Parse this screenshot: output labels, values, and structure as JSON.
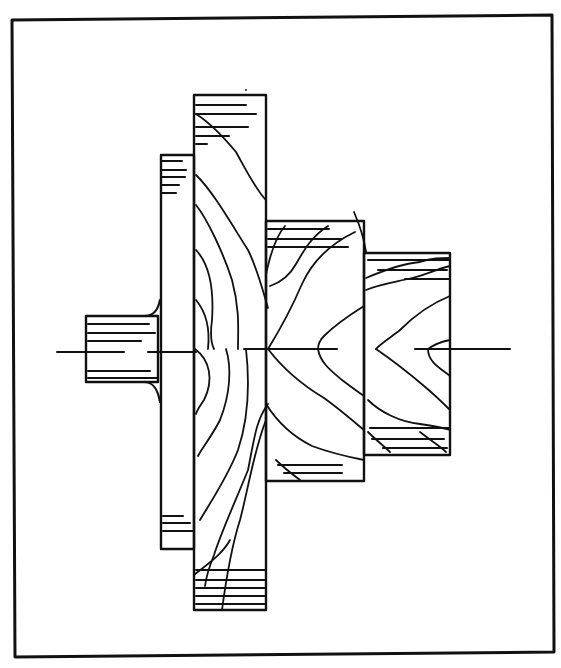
{
  "diagram": {
    "kind": "stepped-shaft-forging-grain-flow",
    "stroke_color": "#111111",
    "background": "#ffffff",
    "frame": {
      "x1": 12,
      "y1": 20,
      "x2": 552,
      "y2": 15,
      "x3": 554,
      "y3": 652,
      "x4": 15,
      "y4": 657,
      "width": 3
    },
    "centerline_y": 349,
    "bodies": [
      {
        "name": "left-stub",
        "x": 86,
        "y": 316,
        "w": 72,
        "h": 66
      },
      {
        "name": "thin-flange",
        "x": 161,
        "y": 155,
        "w": 33,
        "h": 394
      },
      {
        "name": "large-disk",
        "x": 194,
        "y": 95,
        "w": 72,
        "h": 515
      },
      {
        "name": "mid-hub",
        "x": 266,
        "y": 221,
        "w": 98,
        "h": 260
      },
      {
        "name": "right-hub",
        "x": 364,
        "y": 253,
        "w": 86,
        "h": 202
      }
    ],
    "hatch_lines": [
      [
        88,
        324,
        149,
        324
      ],
      [
        88,
        333,
        155,
        333
      ],
      [
        88,
        341,
        141,
        341
      ],
      [
        88,
        371,
        150,
        371
      ],
      [
        88,
        378,
        157,
        378
      ],
      [
        162,
        161,
        182,
        161
      ],
      [
        162,
        170,
        186,
        170
      ],
      [
        162,
        177,
        185,
        177
      ],
      [
        162,
        185,
        179,
        185
      ],
      [
        162,
        193,
        176,
        193
      ],
      [
        196,
        105,
        246,
        105
      ],
      [
        196,
        114,
        256,
        114
      ],
      [
        196,
        127,
        248,
        127
      ],
      [
        196,
        136,
        229,
        136
      ],
      [
        196,
        144,
        207,
        144
      ],
      [
        163,
        516,
        183,
        516
      ],
      [
        163,
        523,
        190,
        523
      ],
      [
        163,
        531,
        193,
        531
      ],
      [
        196,
        570,
        265,
        570
      ],
      [
        196,
        580,
        265,
        580
      ],
      [
        196,
        588,
        265,
        588
      ],
      [
        196,
        596,
        265,
        596
      ],
      [
        196,
        604,
        265,
        604
      ],
      [
        268,
        229,
        329,
        229
      ],
      [
        268,
        239,
        341,
        239
      ],
      [
        268,
        247,
        348,
        247
      ],
      [
        368,
        260,
        450,
        260
      ],
      [
        378,
        270,
        447,
        270
      ],
      [
        405,
        279,
        450,
        279
      ],
      [
        370,
        428,
        450,
        428
      ],
      [
        372,
        439,
        444,
        439
      ],
      [
        383,
        448,
        447,
        448
      ],
      [
        278,
        465,
        342,
        465
      ],
      [
        284,
        473,
        342,
        473
      ]
    ],
    "centerlines": [
      [
        57,
        352,
        124,
        352
      ],
      [
        148,
        352,
        196,
        352
      ],
      [
        244,
        349,
        337,
        349
      ],
      [
        415,
        349,
        510,
        349
      ]
    ],
    "flow_curves": [
      "M196,114 C212,124 226,140 236,152 C246,170 256,190 266,200",
      "M196,175 C212,190 232,225 248,250 C258,270 264,295 268,308",
      "M196,205 C208,220 224,255 232,280 C240,310 238,330 238,349",
      "M196,250 C210,265 214,290 212,320 C210,335 212,345 214,349",
      "M196,300 C206,312 210,330 208,349",
      "M195,349 C210,360 214,380 204,400 C200,406 197,410 196,414",
      "M226,349 C232,368 230,395 220,420 C212,436 202,448 198,456",
      "M246,349 C250,385 248,420 238,450 C228,476 212,500 200,520",
      "M268,404 C256,420 254,440 248,470 C236,500 222,530 214,555 C208,570 206,578 205,586",
      "M266,420 C254,450 248,490 240,520 C232,545 226,580 222,610",
      "M246,90 C246,90 246,90 246,90",
      "M194,575 C206,565 222,555 230,540",
      "M285,226 C278,234 274,244 270,258 C268,266 266,272 266,276",
      "M328,226 C312,236 304,250 296,264 C290,275 282,282 270,286",
      "M355,232 C330,244 312,262 302,284 C290,312 276,336 268,349",
      "M364,306 C348,316 334,326 324,336 C318,342 318,346 318,349",
      "M268,349 C284,370 304,386 324,398 C338,408 352,420 364,430",
      "M318,349 C320,362 330,370 342,380 C350,386 358,392 364,396",
      "M266,404 C276,420 292,436 312,446 C328,452 344,456 364,460",
      "M276,460 C284,468 292,474 300,480",
      "M354,212 C360,226 364,238 366,252",
      "M366,278 C380,272 400,264 420,262 C432,258 440,258 450,258",
      "M366,290 C380,284 396,282 412,278 C428,274 440,268 450,266",
      "M450,296 C430,304 412,318 400,330 C390,338 380,344 376,349",
      "M376,349 C392,360 410,374 424,386 C436,396 444,404 450,410",
      "M450,340 C440,342 432,346 428,349 C428,362 440,368 450,376",
      "M368,400 C380,412 400,422 420,424 C434,426 444,428 450,430",
      "M368,432 C376,440 384,446 390,452",
      "M420,432 C430,440 440,446 446,452"
    ]
  }
}
